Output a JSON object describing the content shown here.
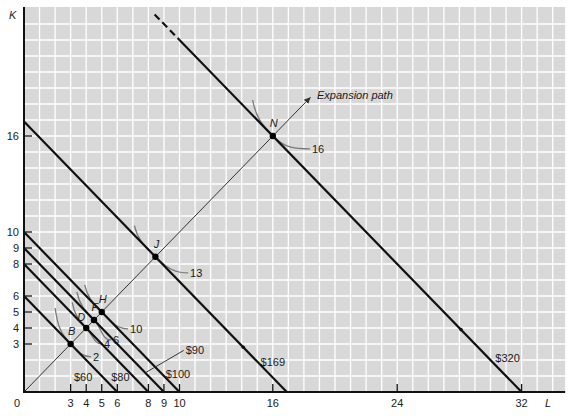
{
  "chart_data": {
    "type": "line",
    "title": "",
    "xlabel": "L",
    "ylabel": "K",
    "xlim": [
      0,
      34.8
    ],
    "ylim": [
      0,
      24
    ],
    "grid": true,
    "origin_label": "0",
    "x_ticks": [
      3,
      4,
      5,
      6,
      8,
      9,
      10,
      16,
      24,
      32
    ],
    "y_ticks": [
      3,
      4,
      5,
      6,
      8,
      9,
      10,
      16
    ],
    "budget_lines": [
      {
        "label": "$60",
        "cost": 60,
        "L_intercept": 6,
        "K_intercept": 6,
        "label_pos": [
          3.8,
          0.94
        ]
      },
      {
        "label": "$80",
        "cost": 80,
        "L_intercept": 8,
        "K_intercept": 8,
        "label_pos": [
          6.2,
          0.94
        ]
      },
      {
        "label": "$90",
        "cost": 90,
        "L_intercept": 9,
        "K_intercept": 9,
        "label_pos": [
          10.4,
          2.6
        ],
        "leader_from": [
          7.8,
          1.2
        ]
      },
      {
        "label": "$100",
        "cost": 100,
        "L_intercept": 10,
        "K_intercept": 10,
        "label_pos": [
          9.9,
          1.1
        ]
      },
      {
        "label": "$169",
        "cost": 169,
        "L_intercept": 16.9,
        "K_intercept": 16.9,
        "label_pos": [
          16.0,
          1.9
        ],
        "marker_at": [
          14.1,
          2.8
        ]
      },
      {
        "label": "$320",
        "cost": 320,
        "L_intercept": 32,
        "K_intercept": 32,
        "label_pos": [
          31.1,
          2.1
        ],
        "marker_at": [
          28.1,
          3.9
        ],
        "visible_from_K": 23.6,
        "dashed_above_K": 22
      }
    ],
    "tangency_points": [
      {
        "name": "B",
        "L": 3,
        "K": 3,
        "output": 2,
        "cost_line": "$60"
      },
      {
        "name": "D",
        "L": 4,
        "K": 4,
        "output": 4,
        "cost_line": "$80"
      },
      {
        "name": "F",
        "L": 4.5,
        "K": 4.5,
        "output": 6,
        "cost_line": "$90"
      },
      {
        "name": "H",
        "L": 5,
        "K": 5,
        "output": 10,
        "cost_line": "$100"
      },
      {
        "name": "J",
        "L": 8.45,
        "K": 8.45,
        "output": 13,
        "cost_line": "$169"
      },
      {
        "name": "N",
        "L": 16,
        "K": 16,
        "output": 16,
        "cost_line": "$320"
      }
    ],
    "isoquants": [
      {
        "label": "2",
        "through": "B",
        "start": [
          2.0,
          5.25
        ],
        "label_pos": [
          4.44,
          2.19
        ]
      },
      {
        "label": "4",
        "through": "D",
        "start": [
          3.1,
          5.6
        ],
        "label_pos": [
          5.14,
          3.0
        ]
      },
      {
        "label": "6",
        "through": "F",
        "start": [
          3.4,
          6.25
        ],
        "label_pos": [
          5.72,
          3.25
        ]
      },
      {
        "label": "10",
        "through": "H",
        "start": [
          3.9,
          6.7
        ],
        "label_pos": [
          6.82,
          3.94
        ]
      },
      {
        "label": "13",
        "through": "J",
        "start": [
          7.1,
          10.4
        ],
        "label_pos": [
          10.68,
          7.44
        ]
      },
      {
        "label": "16",
        "through": "N",
        "start": [
          14.7,
          18.25
        ],
        "label_pos": [
          18.52,
          15.19
        ]
      }
    ],
    "expansion_path": {
      "label": "Expansion path",
      "from": [
        0,
        0
      ],
      "to": [
        18.4,
        18.4
      ],
      "label_pos": [
        18.84,
        18.56
      ]
    },
    "colors": {
      "plot_background": "#d8d8d8",
      "grid": "#ffffff",
      "budget_line": "#111111",
      "isoquant": "#7a7a7a",
      "expansion_path": "#333333"
    }
  }
}
